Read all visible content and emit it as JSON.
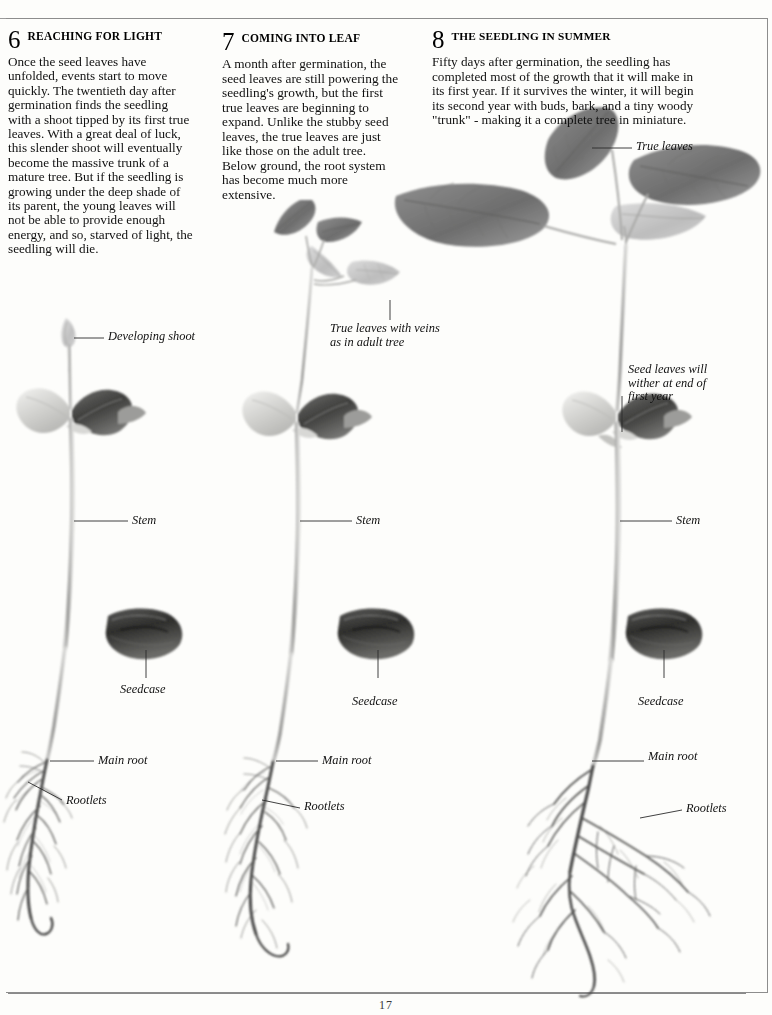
{
  "page": {
    "number": "17",
    "background": "#fdfdfb",
    "ink": "#111111"
  },
  "sections": [
    {
      "number": "6",
      "title": "REACHING FOR LIGHT",
      "body": "Once the seed leaves have unfolded, events start to move quickly. The twentieth day after germination finds the seedling with a shoot tipped by its first true leaves. With a great deal of luck, this slender shoot will eventually become the massive trunk of a mature tree. But if the seedling is growing under the deep shade of its parent, the young leaves will not be able to provide enough energy, and so, starved of light, the seedling will die."
    },
    {
      "number": "7",
      "title": "COMING INTO LEAF",
      "body": "A month after germination, the seed leaves are still powering the seedling's growth, but the first true leaves are beginning to expand. Unlike the stubby seed leaves, the true leaves are just like those on the adult tree. Below ground, the root system has become much more extensive."
    },
    {
      "number": "8",
      "title": "THE SEEDLING IN SUMMER",
      "body": "Fifty days after germination, the seedling has completed most of the growth that it will make in its first year. If it survives the winter, it will begin its second year with buds, bark, and a tiny woody \"trunk\" - making it a complete tree in miniature."
    }
  ],
  "labels": {
    "developing_shoot": "Developing  shoot",
    "true_leaves_veins_line1": "True leaves with veins",
    "true_leaves_veins_line2": "as in adult tree",
    "true_leaves": "True leaves",
    "seed_leaves_wither_line1": "Seed  leaves  will",
    "seed_leaves_wither_line2": "wither at end of",
    "seed_leaves_wither_line3": "first  year",
    "stem_1": "Stem",
    "stem_2": "Stem",
    "stem_3": "Stem",
    "seedcase_1": "Seedcase",
    "seedcase_2": "Seedcase",
    "seedcase_3": "Seedcase",
    "main_root_1": "Main root",
    "main_root_2": "Main root",
    "main_root_3": "Main root",
    "rootlets_1": "Rootlets",
    "rootlets_2": "Rootlets",
    "rootlets_3": "Rootlets"
  }
}
